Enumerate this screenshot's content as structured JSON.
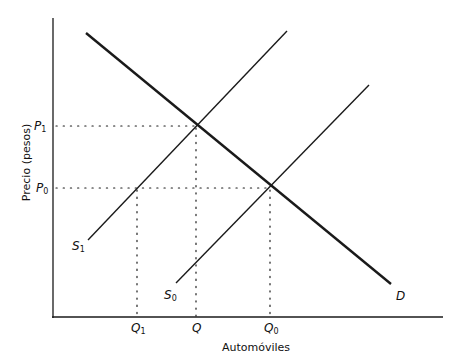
{
  "diagram": {
    "type": "supply-demand",
    "x_axis_label": "Automóviles",
    "y_axis_label": "Precio (pesos)",
    "price_labels": {
      "p1": {
        "base": "P",
        "sub": "1"
      },
      "p0": {
        "base": "P",
        "sub": "0"
      }
    },
    "quantity_labels": {
      "q1": {
        "base": "Q",
        "sub": "1"
      },
      "q": {
        "base": "Q",
        "sub": ""
      },
      "q0": {
        "base": "Q",
        "sub": "0"
      }
    },
    "curve_labels": {
      "s1": {
        "base": "S",
        "sub": "1"
      },
      "s0": {
        "base": "S",
        "sub": "0"
      },
      "d": {
        "base": "D",
        "sub": ""
      }
    },
    "colors": {
      "line": "#1a1a1a",
      "axis": "#1a1a1a",
      "background": "#ffffff"
    }
  }
}
